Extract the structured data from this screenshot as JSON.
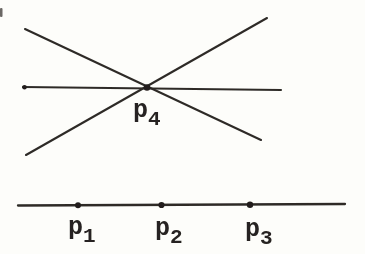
{
  "meta": {
    "background": "#fdfdfa",
    "ink_color": "#2e2b28",
    "width": 365,
    "height": 254
  },
  "diagram": {
    "pencil": {
      "lines": [
        {
          "name": "line-through-p4-descending",
          "x1": 25,
          "y1": 29,
          "x2": 261,
          "y2": 140
        },
        {
          "name": "line-through-p4-horizontal",
          "x1": 23,
          "y1": 87,
          "x2": 281,
          "y2": 90
        },
        {
          "name": "line-through-p4-ascending",
          "x1": 26,
          "y1": 155,
          "x2": 267,
          "y2": 18
        }
      ],
      "endpoint_dot": {
        "x": 24.5,
        "y": 87.3,
        "r": 2.3
      },
      "point": {
        "x": 147,
        "y": 87.5,
        "r": 3.3,
        "label": "p",
        "subscript": "4",
        "label_x": 133,
        "label_y": 117
      }
    },
    "baseline_figure": {
      "line": {
        "name": "line-through-p1-p2-p3",
        "x1": 18,
        "y1": 205.5,
        "x2": 345,
        "y2": 204
      },
      "points": [
        {
          "x": 78,
          "y": 205.2,
          "r": 3,
          "label": "p",
          "subscript": "1",
          "label_x": 68,
          "label_y": 234
        },
        {
          "x": 161.5,
          "y": 205,
          "r": 3.1,
          "label": "p",
          "subscript": "2",
          "label_x": 155,
          "label_y": 235
        },
        {
          "x": 250,
          "y": 204.8,
          "r": 3.2,
          "label": "p",
          "subscript": "3",
          "label_x": 245,
          "label_y": 236
        }
      ]
    },
    "scan_artifact": {
      "x": 0,
      "y": 8,
      "width": 2.5,
      "height": 9
    }
  }
}
